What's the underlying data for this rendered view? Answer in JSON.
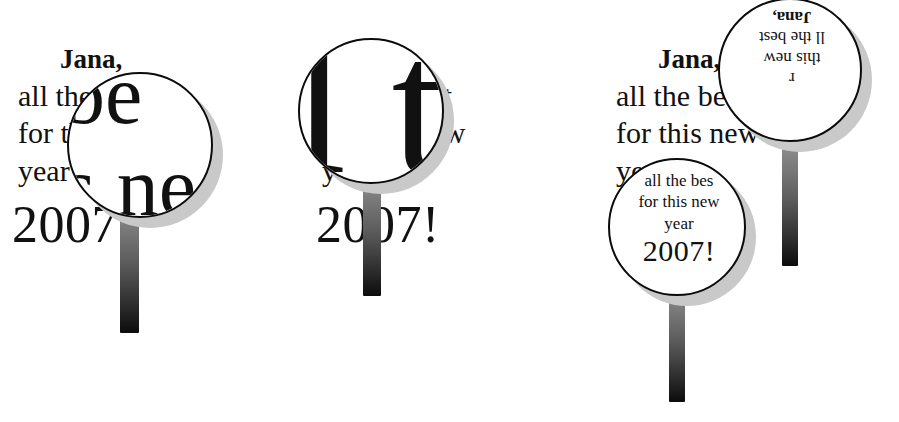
{
  "figure": {
    "background_color": "#ffffff",
    "ink_color": "#111111",
    "shadow_color": "#c9c9c9",
    "handle_gradient_top": "#8d8d8d",
    "handle_gradient_bottom": "#0c0c0c"
  },
  "source_text": {
    "line1": "Jana,",
    "line2": "all the best",
    "line3": "for this new",
    "line4": "year",
    "line5": "2007!"
  },
  "panels": [
    {
      "id": "left",
      "name": "magnification",
      "document": {
        "line1": "Jana,",
        "line2": "all the best",
        "line3": "for this new",
        "line4": "year",
        "line5": "2007!"
      },
      "lens": {
        "visible_text_line1": "be",
        "visible_text_line2": "s ne"
      }
    },
    {
      "id": "middle",
      "name": "extreme-magnification",
      "document": {
        "line1": "Jana,",
        "line2": "all the best",
        "line3": "for this new",
        "line4": "year",
        "line5": "2007!"
      },
      "lens": {
        "visible_text": "l t"
      }
    },
    {
      "id": "right",
      "name": "rotation-and-minification",
      "document": {
        "line1": "Jana,",
        "line2": "all the best",
        "line3": "for this new",
        "line4": "year",
        "line5": "2007!"
      },
      "lens_top": {
        "rotation_degrees": "180",
        "line1": "Jana,",
        "line2": "ll the best",
        "line3": "this new",
        "line4": "r"
      },
      "lens_bottom": {
        "line1": "all the bes",
        "line2": "for this new",
        "line3": "year",
        "line4": "2007!"
      }
    }
  ]
}
